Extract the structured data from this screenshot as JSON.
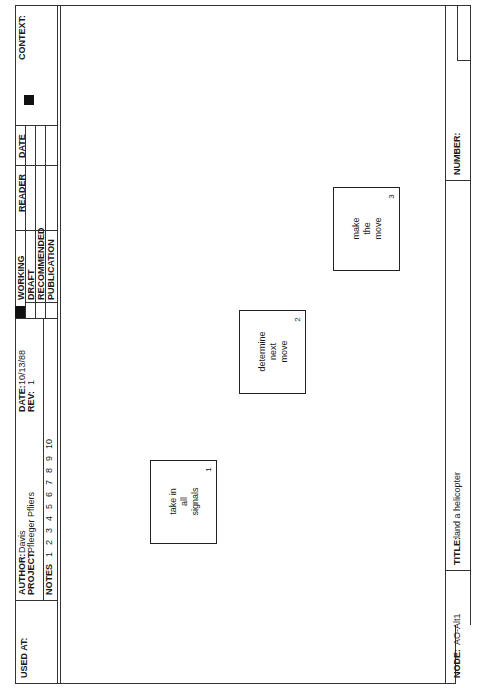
{
  "header": {
    "used_at_label": "USED AT:",
    "author_label": "AUTHOR:",
    "author": "Davis",
    "project_label": "PROJECT:",
    "project": "Pfleeger Pfliers",
    "notes_label": "NOTES",
    "notes_numbers": [
      "1",
      "2",
      "3",
      "4",
      "5",
      "6",
      "7",
      "8",
      "9",
      "10"
    ],
    "date_label": "DATE:",
    "date": "10/13/88",
    "rev_label": "REV:",
    "rev": "1",
    "status": [
      "WORKING",
      "DRAFT",
      "RECOMMENDED",
      "PUBLICATION"
    ],
    "reader_label": "READER",
    "reader_date_label": "DATE",
    "context_label": "CONTEXT:"
  },
  "boxes": [
    {
      "lines": [
        "take in",
        "all",
        "signals"
      ],
      "number": "1"
    },
    {
      "lines": [
        "determine",
        "next",
        "move"
      ],
      "number": "2"
    },
    {
      "lines": [
        "make",
        "the",
        "move"
      ],
      "number": "3"
    }
  ],
  "footer": {
    "node_label": "NODE:",
    "node": "AO-Alt1",
    "title_label": "TITLE:",
    "title": "land a helicopter",
    "number_label": "NUMBER:"
  }
}
